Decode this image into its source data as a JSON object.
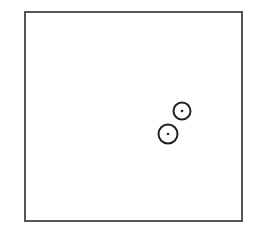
{
  "diagram": {
    "background": "#ffffff",
    "frame": {
      "x": 25,
      "y": 12,
      "width": 217,
      "height": 209,
      "stroke": "#555555",
      "stroke_width": 2
    },
    "markers": [
      {
        "id": "marker-1",
        "cx": 182,
        "cy": 111,
        "r": 8.5,
        "dot_r": 1.3,
        "stroke": "#222222"
      },
      {
        "id": "marker-2",
        "cx": 168,
        "cy": 134,
        "r": 9.5,
        "dot_r": 1.3,
        "stroke": "#222222"
      }
    ]
  }
}
